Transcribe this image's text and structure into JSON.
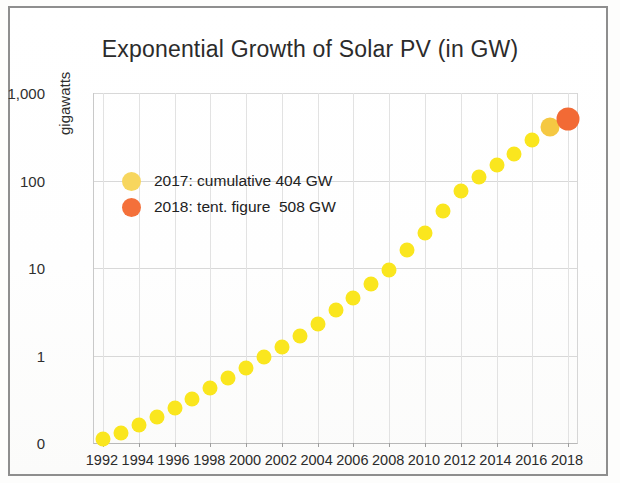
{
  "chart_data": {
    "type": "scatter",
    "title": "Exponential Growth of Solar PV (in GW)",
    "xlabel": "",
    "ylabel": "gigawatts",
    "yscale": "log",
    "grid": true,
    "legend_position": "inside-upper-left",
    "ylim": [
      0,
      1000
    ],
    "y_tick_labels": [
      "1,000",
      "100",
      "10",
      "1",
      "0"
    ],
    "y_tick_values": [
      1000,
      100,
      10,
      1,
      0.1
    ],
    "x_tick_labels": [
      "1992",
      "1994",
      "1996",
      "1998",
      "2000",
      "2002",
      "2004",
      "2006",
      "2008",
      "2010",
      "2012",
      "2014",
      "2016",
      "2018"
    ],
    "x_tick_values": [
      1992,
      1994,
      1996,
      1998,
      2000,
      2002,
      2004,
      2006,
      2008,
      2010,
      2012,
      2014,
      2016,
      2018
    ],
    "xlim": [
      1991.5,
      2018.5
    ],
    "x": [
      1992,
      1993,
      1994,
      1995,
      1996,
      1997,
      1998,
      1999,
      2000,
      2001,
      2002,
      2003,
      2004,
      2005,
      2006,
      2007,
      2008,
      2009,
      2010,
      2011,
      2012,
      2013,
      2014,
      2015,
      2016,
      2017,
      2018
    ],
    "values": [
      0.11,
      0.13,
      0.16,
      0.2,
      0.25,
      0.32,
      0.42,
      0.55,
      0.72,
      0.95,
      1.25,
      1.65,
      2.3,
      3.3,
      4.6,
      6.6,
      9.5,
      16,
      25,
      45,
      75,
      110,
      150,
      200,
      290,
      404,
      508
    ],
    "series": [
      {
        "name": "cumulative installed solar PV capacity",
        "unit": "GW",
        "values": [
          0.11,
          0.13,
          0.16,
          0.2,
          0.25,
          0.32,
          0.42,
          0.55,
          0.72,
          0.95,
          1.25,
          1.65,
          2.3,
          3.3,
          4.6,
          6.6,
          9.5,
          16,
          25,
          45,
          75,
          110,
          150,
          200,
          290,
          404,
          508
        ]
      }
    ],
    "annotations": [
      {
        "year": 2017,
        "value": 404,
        "label": "2017: cumulative 404 GW"
      },
      {
        "year": 2018,
        "value": 508,
        "label": "2018: tent. figure  508 GW"
      }
    ],
    "colors": {
      "marker_default": "#FAE61E",
      "marker_2017": "#F5C842",
      "marker_2018": "#F26A35",
      "legend_swatch_2017": "#F7D65E",
      "legend_swatch_2018": "#F4703A",
      "grid": "#D8D8D8",
      "axis": "#B8B8B8",
      "text": "#2B2B2B"
    }
  },
  "legend": {
    "items": [
      {
        "label": "2017: cumulative 404 GW"
      },
      {
        "label": "2018: tent. figure  508 GW"
      }
    ]
  }
}
